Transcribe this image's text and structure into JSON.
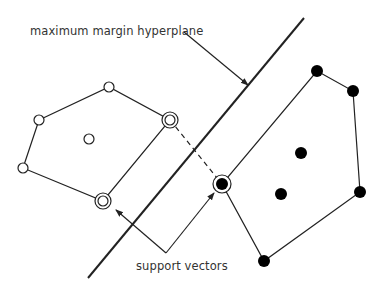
{
  "diagram": {
    "labels": {
      "hyperplane": "maximum margin hyperplane",
      "support_vectors": "support vectors"
    },
    "colors": {
      "stroke": "#222222",
      "fill_class_a": "#ffffff",
      "fill_class_b": "#000000",
      "text": "#333333"
    },
    "class_a_points": [
      {
        "x": 39,
        "y": 120,
        "support": false
      },
      {
        "x": 109,
        "y": 87,
        "support": false
      },
      {
        "x": 170,
        "y": 120,
        "support": true
      },
      {
        "x": 89,
        "y": 139,
        "support": false
      },
      {
        "x": 23,
        "y": 168,
        "support": false
      },
      {
        "x": 103,
        "y": 201,
        "support": true
      }
    ],
    "class_a_hull": [
      [
        39,
        120
      ],
      [
        109,
        87
      ],
      [
        170,
        120
      ],
      [
        103,
        201
      ],
      [
        23,
        168
      ]
    ],
    "class_b_points": [
      {
        "x": 317,
        "y": 71,
        "support": false
      },
      {
        "x": 353,
        "y": 91,
        "support": false
      },
      {
        "x": 301,
        "y": 153,
        "support": false
      },
      {
        "x": 281,
        "y": 194,
        "support": false
      },
      {
        "x": 360,
        "y": 192,
        "support": false
      },
      {
        "x": 264,
        "y": 261,
        "support": false
      },
      {
        "x": 222,
        "y": 184,
        "support": true
      }
    ],
    "class_b_hull": [
      [
        317,
        71
      ],
      [
        353,
        91
      ],
      [
        360,
        192
      ],
      [
        264,
        261
      ],
      [
        222,
        184
      ]
    ],
    "hyperplane": {
      "x1": 304,
      "y1": 18,
      "x2": 88,
      "y2": 278
    },
    "margin_connector_dashed": {
      "x1": 170,
      "y1": 120,
      "x2": 222,
      "y2": 184
    }
  }
}
